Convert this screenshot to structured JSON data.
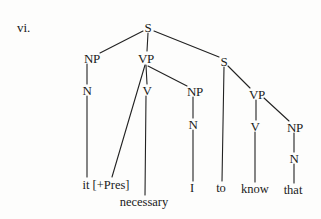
{
  "example_label": "vi.",
  "tree": {
    "root": {
      "label": "S",
      "x": 148,
      "y": 27
    },
    "nodes": {
      "np1": {
        "label": "NP",
        "x": 92,
        "y": 58
      },
      "n1": {
        "label": "N",
        "x": 87,
        "y": 90
      },
      "vp1": {
        "label": "VP",
        "x": 146,
        "y": 58
      },
      "v1": {
        "label": "V",
        "x": 147,
        "y": 90
      },
      "np2": {
        "label": "NP",
        "x": 195,
        "y": 91
      },
      "n2": {
        "label": "N",
        "x": 193,
        "y": 124
      },
      "s2": {
        "label": "S",
        "x": 224,
        "y": 61
      },
      "vp2": {
        "label": "VP",
        "x": 257,
        "y": 94
      },
      "v2": {
        "label": "V",
        "x": 255,
        "y": 126
      },
      "np3": {
        "label": "NP",
        "x": 295,
        "y": 127
      },
      "n3": {
        "label": "N",
        "x": 294,
        "y": 158
      }
    },
    "leaves": {
      "it": {
        "text": "it [+Pres]",
        "x": 106,
        "y": 185
      },
      "necessary": {
        "text": "necessary",
        "x": 144,
        "y": 202
      },
      "I": {
        "text": "I",
        "x": 192,
        "y": 188
      },
      "to": {
        "text": "to",
        "x": 221,
        "y": 188
      },
      "know": {
        "text": "know",
        "x": 255,
        "y": 189
      },
      "that": {
        "text": "that",
        "x": 293,
        "y": 190
      }
    },
    "bracketing": "[S [NP [N it]] [VP [+Pres] [V necessary] [NP [N I]]] [S to [VP [V know] [NP [N that]]]]]"
  },
  "colors": {
    "ink": "#1a1a1a",
    "paper": "#fdfdfc"
  }
}
